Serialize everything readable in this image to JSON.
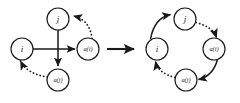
{
  "figure": {
    "background_color": "#ffffff",
    "ink_color": "#1a1a1a",
    "width": 240,
    "height": 103
  },
  "left_graph": {
    "name": "left-graph",
    "nodes": [
      {
        "id": "j",
        "label": "j",
        "style": "simple",
        "cx": 58,
        "cy": 19,
        "r": 11
      },
      {
        "id": "i",
        "label": "i",
        "style": "simple",
        "cx": 22,
        "cy": 49,
        "r": 11
      },
      {
        "id": "ai",
        "label": "a(i)",
        "style": "func",
        "cx": 88,
        "cy": 49,
        "r": 11
      },
      {
        "id": "aj",
        "label": "a(j)",
        "style": "func",
        "cx": 58,
        "cy": 80,
        "r": 11
      }
    ],
    "edges": [
      {
        "from": "i",
        "to": "ai",
        "style": "solid",
        "shape": "straight"
      },
      {
        "from": "j",
        "to": "aj",
        "style": "solid",
        "shape": "straight"
      },
      {
        "from": "ai",
        "to": "j",
        "style": "dotted",
        "shape": "curved"
      },
      {
        "from": "aj",
        "to": "i",
        "style": "dotted",
        "shape": "curved"
      }
    ]
  },
  "transition": {
    "name": "transition-arrow",
    "label": "",
    "from_x": 106,
    "to_x": 140,
    "y": 49
  },
  "right_graph": {
    "name": "right-graph",
    "nodes": [
      {
        "id": "j",
        "label": "j",
        "style": "simple",
        "cx": 185,
        "cy": 19,
        "r": 11
      },
      {
        "id": "i",
        "label": "i",
        "style": "simple",
        "cx": 157,
        "cy": 49,
        "r": 11
      },
      {
        "id": "ai",
        "label": "a(i)",
        "style": "func",
        "cx": 214,
        "cy": 49,
        "r": 11
      },
      {
        "id": "aj",
        "label": "a(j)",
        "style": "func",
        "cx": 186,
        "cy": 80,
        "r": 11
      }
    ],
    "edges": [
      {
        "from": "i",
        "to": "j",
        "style": "solid",
        "shape": "curved"
      },
      {
        "from": "j",
        "to": "ai",
        "style": "dotted",
        "shape": "curved"
      },
      {
        "from": "ai",
        "to": "aj",
        "style": "solid",
        "shape": "curved"
      },
      {
        "from": "aj",
        "to": "i",
        "style": "dotted",
        "shape": "curved"
      }
    ]
  }
}
